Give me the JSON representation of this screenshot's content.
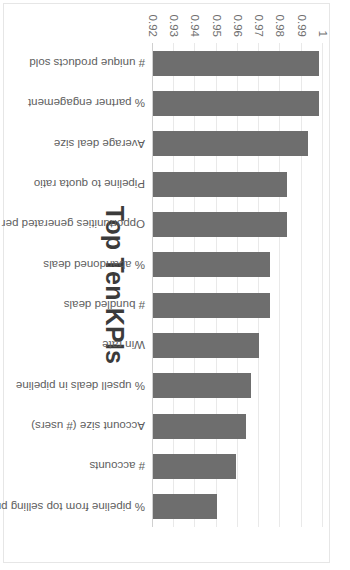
{
  "chart_data": {
    "type": "bar",
    "title": "Top Ten KPIs",
    "xlabel": "",
    "ylabel": "",
    "orientation": "rotated-90",
    "grid": true,
    "legend": "none",
    "ylim": [
      0.92,
      1
    ],
    "tick_labels": [
      "0.92",
      "0.93",
      "0.94",
      "0.95",
      "0.96",
      "0.97",
      "0.98",
      "0.99",
      "1"
    ],
    "tick_values": [
      0.92,
      0.93,
      0.94,
      0.95,
      0.96,
      0.97,
      0.98,
      0.99,
      1
    ],
    "bar_color": "#6e6e6e",
    "grid_color": "#e9e9e9",
    "categories": [
      "# unique products sold",
      "% partner engagement",
      "Average deal size",
      "Pipeline to quota ratio",
      "Opportunities generated per quarter",
      "% abandoned deals",
      "# bundled deals",
      "Win rate",
      "% upsell deals in pipeline",
      "Account size (# users)",
      "# accounts",
      "% pipeline from top selling products"
    ],
    "values": [
      0.998,
      0.998,
      0.993,
      0.983,
      0.983,
      0.975,
      0.975,
      0.97,
      0.966,
      0.964,
      0.959,
      0.95
    ]
  }
}
